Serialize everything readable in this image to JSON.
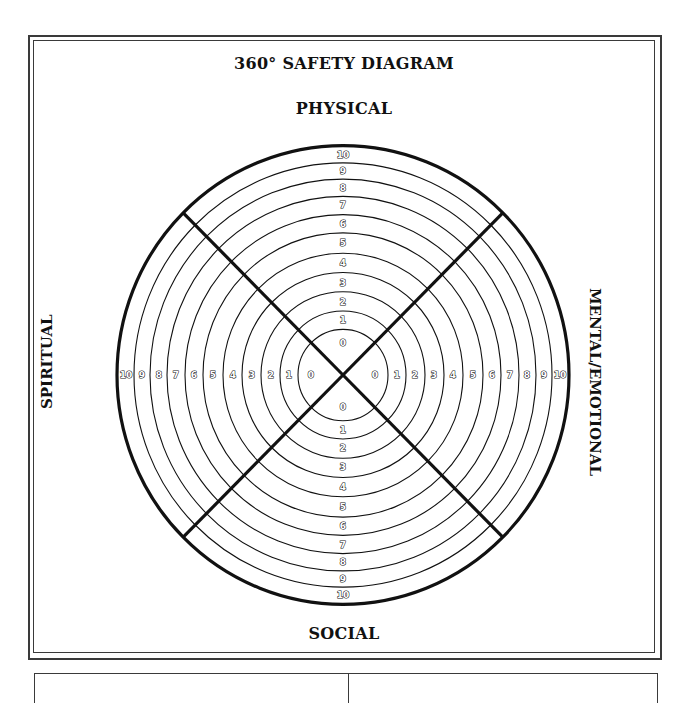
{
  "page": {
    "title": "360° SAFETY DIAGRAM",
    "labels": {
      "top": "PHYSICAL",
      "right": "MENTAL/EMOTIONAL",
      "bottom": "SOCIAL",
      "left": "SPIRITUAL"
    }
  },
  "diagram": {
    "center": [
      343,
      375
    ],
    "ring_radii": [
      45,
      63,
      82,
      101,
      120,
      140,
      158,
      176,
      193,
      209
    ],
    "outer_radius": 226,
    "y_scale": 1.015,
    "scale_labels": [
      "0",
      "1",
      "2",
      "3",
      "4",
      "5",
      "6",
      "7",
      "8",
      "9",
      "10"
    ],
    "label_radii": [
      32,
      54,
      72,
      91,
      110,
      130,
      149,
      167,
      184,
      201,
      217
    ],
    "colors": {
      "line": "#111111",
      "background": "#ffffff",
      "frame": "#3a3a3a"
    }
  }
}
